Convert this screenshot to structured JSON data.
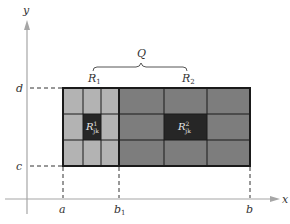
{
  "diagram": {
    "colors": {
      "r1_fill": "#b3b3b3",
      "r2_fill": "#7d7d7d",
      "highlight_fill": "#262626",
      "grid_line": "#1a1a1a",
      "axis": "#a6a6a6",
      "dash": "#333333"
    },
    "axes": {
      "x_label": "x",
      "y_label": "y"
    },
    "x_ticks": [
      {
        "base": "a",
        "sub": ""
      },
      {
        "base": "b",
        "sub": "1"
      },
      {
        "base": "b",
        "sub": ""
      }
    ],
    "y_ticks": [
      {
        "base": "d"
      },
      {
        "base": "c"
      }
    ],
    "brace_label": "Q",
    "regions": [
      {
        "base": "R",
        "sub": "1"
      },
      {
        "base": "R",
        "sub": "2"
      }
    ],
    "cells": [
      {
        "base": "R",
        "sup": "1",
        "sub": "jk"
      },
      {
        "base": "R",
        "sup": "2",
        "sub": "jk"
      }
    ]
  }
}
